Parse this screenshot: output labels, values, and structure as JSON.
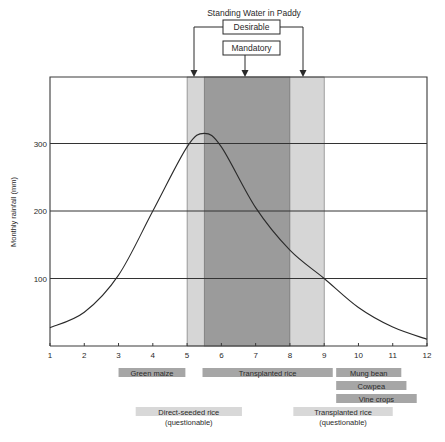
{
  "chart_data": {
    "type": "line",
    "title": "Standing Water in Paddy",
    "xlabel": "",
    "ylabel": "Monthly rainfall (mm)",
    "xlim": [
      1,
      12
    ],
    "ylim": [
      0,
      400
    ],
    "x_ticks": [
      1,
      2,
      3,
      4,
      5,
      6,
      7,
      8,
      9,
      10,
      11,
      12
    ],
    "y_ticks": [
      100,
      200,
      300
    ],
    "grid": "horizontal",
    "series": [
      {
        "name": "Monthly rainfall",
        "x": [
          1,
          2,
          3,
          4,
          5,
          5.5,
          6,
          7,
          8,
          9,
          10,
          11,
          12
        ],
        "values": [
          27,
          50,
          105,
          200,
          295,
          315,
          295,
          205,
          142,
          100,
          57,
          28,
          10
        ]
      }
    ],
    "bands": [
      {
        "label": "Desirable",
        "from": 5,
        "to": 9,
        "color": "#d6d6d6"
      },
      {
        "label": "Mandatory",
        "from": 5.5,
        "to": 8,
        "color": "#9b9b9b"
      }
    ],
    "annotations": {
      "header": "Standing Water in Paddy",
      "desirable_label": "Desirable",
      "mandatory_label": "Mandatory"
    },
    "crops": [
      {
        "label": "Green maize",
        "sublabel": "",
        "from": 3.0,
        "to": 4.95,
        "row": 0,
        "shade": "dark"
      },
      {
        "label": "Transplanted rice",
        "sublabel": "",
        "from": 5.45,
        "to": 9.25,
        "row": 0,
        "shade": "dark"
      },
      {
        "label": "Mung bean",
        "sublabel": "",
        "from": 9.35,
        "to": 11.25,
        "row": 0,
        "shade": "dark"
      },
      {
        "label": "Cowpea",
        "sublabel": "",
        "from": 9.35,
        "to": 11.4,
        "row": 1,
        "shade": "dark"
      },
      {
        "label": "Vine crops",
        "sublabel": "",
        "from": 9.35,
        "to": 11.7,
        "row": 2,
        "shade": "dark"
      },
      {
        "label": "Direct-seeded rice",
        "sublabel": "(questionable)",
        "from": 3.5,
        "to": 6.6,
        "row": 3,
        "shade": "light"
      },
      {
        "label": "Transplanted rice",
        "sublabel": "(questionable)",
        "from": 8.1,
        "to": 11.0,
        "row": 3,
        "shade": "light"
      }
    ]
  },
  "colors": {
    "axis": "#3a3a3a",
    "line": "#2a2a2a",
    "desirable_band": "#d6d6d6",
    "mandatory_band": "#9b9b9b",
    "crop_dark": "#a6a6a6",
    "crop_light": "#d8d8d8"
  }
}
